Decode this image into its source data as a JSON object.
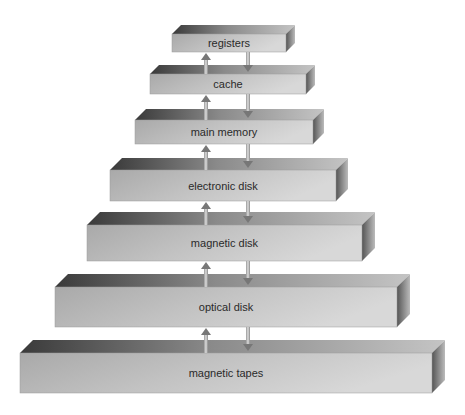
{
  "diagram": {
    "type": "storage-hierarchy",
    "levels": [
      {
        "label": "registers",
        "x": 172,
        "y": 34,
        "w": 114,
        "h": 18,
        "d": 9
      },
      {
        "label": "cache",
        "x": 150,
        "y": 74,
        "w": 156,
        "h": 20,
        "d": 9
      },
      {
        "label": "main memory",
        "x": 135,
        "y": 120,
        "w": 178,
        "h": 24,
        "d": 11
      },
      {
        "label": "electronic disk",
        "x": 110,
        "y": 170,
        "w": 226,
        "h": 31,
        "d": 12
      },
      {
        "label": "magnetic disk",
        "x": 87,
        "y": 225,
        "w": 275,
        "h": 36,
        "d": 13
      },
      {
        "label": "optical disk",
        "x": 55,
        "y": 287,
        "w": 342,
        "h": 40,
        "d": 13
      },
      {
        "label": "magnetic tapes",
        "x": 20,
        "y": 353,
        "w": 412,
        "h": 40,
        "d": 13
      }
    ],
    "arrows": {
      "up_x": 206,
      "down_x": 248
    }
  }
}
